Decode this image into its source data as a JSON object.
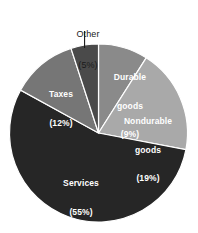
{
  "chart_data": {
    "type": "pie",
    "title": "",
    "subtitle": "",
    "xlabel": "",
    "ylabel": "",
    "legend_position": "none",
    "grid": false,
    "start_angle_deg": 0,
    "direction": "clockwise",
    "categories": [
      "Durable goods",
      "Nondurable goods",
      "Services",
      "Taxes",
      "Other"
    ],
    "values": [
      9,
      19,
      55,
      12,
      5
    ],
    "value_unit": "%",
    "slices": [
      {
        "name": "Durable goods",
        "label_line1": "Durable",
        "label_line2": "goods",
        "percent_text": "(9%)",
        "value": 9,
        "color": "#8a8a8a",
        "label_color": "#ffffff",
        "label_placement": "inside",
        "start_deg": 0,
        "end_deg": 32.4
      },
      {
        "name": "Nondurable goods",
        "label_line1": "Nondurable",
        "label_line2": "goods",
        "percent_text": "(19%)",
        "value": 19,
        "color": "#a9a9a9",
        "label_color": "#ffffff",
        "label_placement": "inside",
        "start_deg": 32.4,
        "end_deg": 100.8
      },
      {
        "name": "Services",
        "label_line1": "Services",
        "label_line2": "",
        "percent_text": "(55%)",
        "value": 55,
        "color": "#262626",
        "label_color": "#ffffff",
        "label_placement": "inside",
        "start_deg": 100.8,
        "end_deg": 298.8
      },
      {
        "name": "Taxes",
        "label_line1": "Taxes",
        "label_line2": "",
        "percent_text": "(12%)",
        "value": 12,
        "color": "#767676",
        "label_color": "#ffffff",
        "label_placement": "inside",
        "start_deg": 298.8,
        "end_deg": 342.0
      },
      {
        "name": "Other",
        "label_line1": "Other",
        "label_line2": "",
        "percent_text": "(5%)",
        "value": 5,
        "color": "#4a4a4a",
        "label_color": "#1a1a1a",
        "label_placement": "callout",
        "start_deg": 342.0,
        "end_deg": 360.0
      }
    ],
    "background_color": "#ffffff",
    "slice_border_color": "#ffffff",
    "callout_line_color": "#1a1a1a"
  }
}
